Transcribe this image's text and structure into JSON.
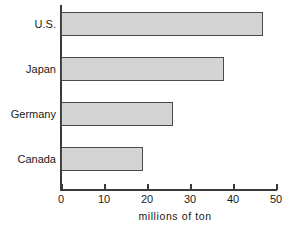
{
  "chart_data": {
    "type": "bar",
    "orientation": "horizontal",
    "title": "",
    "subtitle": "",
    "categories": [
      "U.S.",
      "Japan",
      "Germany",
      "Canada"
    ],
    "values": [
      47,
      38,
      26,
      19
    ],
    "xlabel": "millions of ton",
    "ylabel": "",
    "xlim": [
      0,
      50
    ],
    "xticks": [
      0,
      10,
      20,
      30,
      40,
      50
    ],
    "xtick_labels": [
      "0",
      "10",
      "20",
      "30",
      "40",
      "50"
    ],
    "grid": false,
    "legend": false,
    "legend_position": "none",
    "bar_fill_color": "#d4d4d4",
    "bar_border_color": "#4a4a4a",
    "axis_color": "#3a3a3a",
    "background_color": "#ffffff",
    "bars": [
      {
        "label": "U.S.",
        "value": 47
      },
      {
        "label": "Japan",
        "value": 38
      },
      {
        "label": "Germany",
        "value": 26
      },
      {
        "label": "Canada",
        "value": 19
      }
    ]
  }
}
